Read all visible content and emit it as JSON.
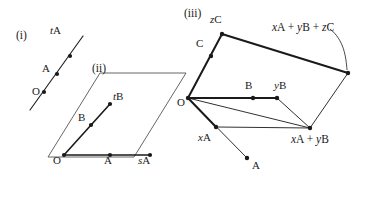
{
  "figure": {
    "caption_tags": [
      {
        "id": "i",
        "text": "(i)",
        "x": 16,
        "y": 30
      },
      {
        "id": "ii",
        "text": "(ii)",
        "x": 92,
        "y": 63
      },
      {
        "id": "iii",
        "text": "(iii)",
        "x": 184,
        "y": 8
      }
    ]
  },
  "panel_i": {
    "name": "line-through-origin",
    "points": [
      {
        "name": "O",
        "label": "O",
        "x": 44,
        "y": 92,
        "label_x": 32,
        "label_y": 86
      },
      {
        "name": "A",
        "label": "A",
        "x": 57,
        "y": 74,
        "label_x": 42,
        "label_y": 63
      },
      {
        "name": "tA",
        "label": "tA",
        "italic_prefix": "t",
        "upright_rest": "A",
        "x": 70,
        "y": 56,
        "label_x": 50,
        "label_y": 25
      }
    ],
    "line": {
      "x1": 30,
      "y1": 110,
      "x2": 83,
      "y2": 36
    }
  },
  "panel_ii": {
    "name": "plane-parallelogram",
    "parallelogram": [
      {
        "x": 48,
        "y": 157
      },
      {
        "x": 100,
        "y": 73
      },
      {
        "x": 186,
        "y": 73
      },
      {
        "x": 134,
        "y": 157
      }
    ],
    "points": [
      {
        "name": "O",
        "label": "O",
        "x": 64,
        "y": 155,
        "label_x": 53,
        "label_y": 155
      },
      {
        "name": "A",
        "label": "A",
        "x": 110,
        "y": 155,
        "label_x": 104,
        "label_y": 155
      },
      {
        "name": "sA",
        "label": "sA",
        "italic_prefix": "s",
        "upright_rest": "A",
        "x": 150,
        "y": 155,
        "label_x": 138,
        "label_y": 155
      },
      {
        "name": "B",
        "label": "B",
        "x": 91,
        "y": 125,
        "label_x": 78,
        "label_y": 112
      },
      {
        "name": "tB",
        "label": "tB",
        "italic_prefix": "t",
        "upright_rest": "B",
        "x": 110,
        "y": 104,
        "label_x": 113,
        "label_y": 91
      }
    ],
    "vectors": [
      {
        "name": "O-to-sA",
        "x1": 64,
        "y1": 155,
        "x2": 150,
        "y2": 155
      },
      {
        "name": "O-to-tB",
        "x1": 64,
        "y1": 155,
        "x2": 110,
        "y2": 104
      }
    ]
  },
  "panel_iii": {
    "name": "parallelepiped-vectors",
    "origin": {
      "name": "O",
      "label": "O",
      "x": 188,
      "y": 98,
      "label_x": 177,
      "label_y": 97
    },
    "points": [
      {
        "name": "C",
        "label": "C",
        "x": 211,
        "y": 56,
        "label_x": 196,
        "label_y": 38
      },
      {
        "name": "zC",
        "label": "zC",
        "italic_prefix": "z",
        "upright_rest": "C",
        "x": 222,
        "y": 34,
        "label_x": 210,
        "label_y": 14
      },
      {
        "name": "B",
        "label": "B",
        "x": 253,
        "y": 98,
        "label_x": 245,
        "label_y": 80
      },
      {
        "name": "yB",
        "label": "yB",
        "italic_prefix": "y",
        "upright_rest": "B",
        "x": 277,
        "y": 98,
        "label_x": 274,
        "label_y": 80
      },
      {
        "name": "xA",
        "label": "xA",
        "italic_prefix": "x",
        "upright_rest": "A",
        "x": 216,
        "y": 127,
        "label_x": 198,
        "label_y": 132
      },
      {
        "name": "A",
        "label": "A",
        "x": 247,
        "y": 158,
        "label_x": 252,
        "label_y": 160
      },
      {
        "name": "xA-plus-yB",
        "label": "xA + yB",
        "x": 310,
        "y": 128,
        "label_x": 291,
        "label_y": 134
      },
      {
        "name": "xA-plus-yB-plus-zC",
        "label": "xA + yB + zC",
        "x": 348,
        "y": 73,
        "label_x": 272,
        "label_y": 22
      }
    ],
    "edges": [
      {
        "name": "O-to-zC",
        "x1": 188,
        "y1": 98,
        "x2": 222,
        "y2": 34,
        "weight": "thick"
      },
      {
        "name": "O-to-yB",
        "x1": 188,
        "y1": 98,
        "x2": 277,
        "y2": 98,
        "weight": "thick"
      },
      {
        "name": "O-to-xA",
        "x1": 188,
        "y1": 98,
        "x2": 216,
        "y2": 127,
        "weight": "thick"
      },
      {
        "name": "O-to-A",
        "x1": 188,
        "y1": 98,
        "x2": 247,
        "y2": 158,
        "weight": "thin"
      },
      {
        "name": "O-to-sum-xy",
        "x1": 188,
        "y1": 98,
        "x2": 310,
        "y2": 128,
        "weight": "thin"
      },
      {
        "name": "xA-to-sum-xy",
        "x1": 216,
        "y1": 127,
        "x2": 310,
        "y2": 128,
        "weight": "thin"
      },
      {
        "name": "yB-to-sum-xy",
        "x1": 277,
        "y1": 98,
        "x2": 310,
        "y2": 128,
        "weight": "thin"
      },
      {
        "name": "zC-to-sum-xyz",
        "x1": 222,
        "y1": 34,
        "x2": 348,
        "y2": 73,
        "weight": "thick"
      },
      {
        "name": "sum-xy-to-sum-xyz",
        "x1": 310,
        "y1": 128,
        "x2": 348,
        "y2": 73,
        "weight": "thin"
      }
    ],
    "leader_arc": {
      "name": "leader-to-sum-xyz",
      "path": "M 330 29 C 344 40 346 57 347 70"
    }
  }
}
